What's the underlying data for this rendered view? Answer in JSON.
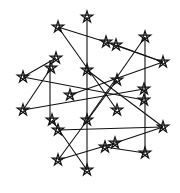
{
  "figure": {
    "width": 180,
    "height": 193,
    "background": "#ffffff",
    "stroke_color": "#111111",
    "star_radius": 6,
    "stars": [
      {
        "x": 87,
        "y": 17
      },
      {
        "x": 58,
        "y": 27
      },
      {
        "x": 145,
        "y": 37
      },
      {
        "x": 163,
        "y": 62
      },
      {
        "x": 163,
        "y": 127
      },
      {
        "x": 145,
        "y": 153
      },
      {
        "x": 87,
        "y": 170
      },
      {
        "x": 58,
        "y": 160
      },
      {
        "x": 23,
        "y": 77
      },
      {
        "x": 23,
        "y": 110
      },
      {
        "x": 87,
        "y": 70
      },
      {
        "x": 117,
        "y": 80
      },
      {
        "x": 117,
        "y": 110
      },
      {
        "x": 87,
        "y": 120
      },
      {
        "x": 70,
        "y": 95
      },
      {
        "x": 106,
        "y": 42
      },
      {
        "x": 116,
        "y": 45
      },
      {
        "x": 56,
        "y": 58
      },
      {
        "x": 51,
        "y": 68
      },
      {
        "x": 144,
        "y": 89
      },
      {
        "x": 144,
        "y": 100
      },
      {
        "x": 52,
        "y": 120
      },
      {
        "x": 58,
        "y": 130
      },
      {
        "x": 105,
        "y": 147
      },
      {
        "x": 115,
        "y": 143
      }
    ],
    "lines": [
      [
        87,
        17,
        87,
        170
      ],
      [
        58,
        27,
        117,
        110
      ],
      [
        58,
        27,
        106,
        42
      ],
      [
        145,
        37,
        145,
        153
      ],
      [
        145,
        37,
        87,
        120
      ],
      [
        163,
        62,
        116,
        45
      ],
      [
        163,
        62,
        70,
        95
      ],
      [
        163,
        127,
        58,
        130
      ],
      [
        163,
        127,
        87,
        70
      ],
      [
        145,
        153,
        105,
        147
      ],
      [
        87,
        170,
        52,
        120
      ],
      [
        58,
        160,
        117,
        80
      ],
      [
        58,
        160,
        115,
        143
      ],
      [
        23,
        77,
        144,
        100
      ],
      [
        23,
        77,
        56,
        58
      ],
      [
        23,
        110,
        144,
        89
      ],
      [
        23,
        110,
        51,
        68
      ],
      [
        50,
        60,
        50,
        125
      ],
      [
        106,
        42,
        163,
        62
      ],
      [
        115,
        143,
        163,
        127
      ]
    ]
  }
}
